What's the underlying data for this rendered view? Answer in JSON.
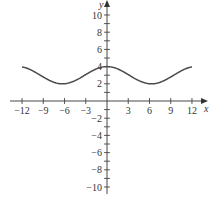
{
  "chart_data": {
    "type": "line",
    "title": "",
    "xlabel": "x",
    "ylabel": "y",
    "xlim": [
      -12,
      12
    ],
    "ylim": [
      -10,
      10
    ],
    "grid": false,
    "function": "y = 3 + cos(x/2)",
    "x_ticks": [
      -12,
      -9,
      -6,
      -3,
      3,
      6,
      9,
      12
    ],
    "x_tick_labels": [
      "−12",
      "−9",
      "−6",
      "−3",
      "3",
      "6",
      "9",
      "12"
    ],
    "y_ticks": [
      -10,
      -9,
      -8,
      -7,
      -6,
      -5,
      -4,
      -3,
      -2,
      -1,
      1,
      2,
      3,
      4,
      5,
      6,
      7,
      8,
      9,
      10
    ],
    "y_labeled_ticks": [
      -10,
      -8,
      -6,
      -4,
      -2,
      2,
      4,
      6,
      8,
      10
    ],
    "y_tick_labels": [
      "−10",
      "−8",
      "−6",
      "−4",
      "−2",
      "2",
      "4",
      "6",
      "8",
      "10"
    ],
    "series": [
      {
        "name": "curve",
        "color": "#4a4a4a",
        "x": [
          -12,
          -11,
          -10,
          -9,
          -8,
          -7,
          -6,
          -5,
          -4,
          -3,
          -2,
          -1,
          0,
          1,
          2,
          3,
          4,
          5,
          6,
          7,
          8,
          9,
          10,
          11,
          12
        ],
        "y": [
          3.96,
          3.71,
          3.28,
          2.79,
          2.35,
          2.06,
          2.01,
          2.2,
          2.58,
          3.07,
          3.54,
          3.88,
          4.0,
          3.88,
          3.54,
          3.07,
          2.58,
          2.2,
          2.01,
          2.06,
          2.35,
          2.79,
          3.28,
          3.71,
          3.96
        ]
      }
    ]
  }
}
